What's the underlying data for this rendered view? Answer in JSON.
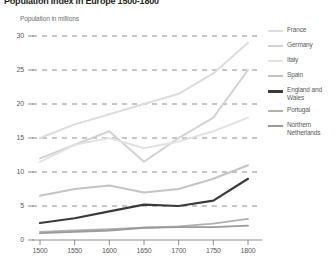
{
  "title": "Population Index in Europe 1500-1800",
  "subtitle": "Population in millions",
  "axis": {
    "y_ticks": [
      "30",
      "25",
      "20",
      "15",
      "10",
      "5",
      "0"
    ],
    "x_ticks": [
      "1500",
      "1550",
      "1600",
      "1650",
      "1700",
      "1750",
      "1800"
    ]
  },
  "legend": {
    "items": [
      {
        "label": "France",
        "color": "#dcdcdc"
      },
      {
        "label": "Germany",
        "color": "#d2d2d2"
      },
      {
        "label": "Italy",
        "color": "#e2e2e2"
      },
      {
        "label": "Spain",
        "color": "#c4c4c4"
      },
      {
        "label": "England and Wales",
        "color": "#3a3a3a"
      },
      {
        "label": "Portugal",
        "color": "#b0b0b0"
      },
      {
        "label": "Northern Netherlands",
        "color": "#9a9a9a"
      }
    ]
  },
  "chart_data": {
    "type": "line",
    "title": "Population Index in Europe 1500-1800",
    "xlabel": "",
    "ylabel": "Population in millions",
    "x": [
      1500,
      1550,
      1600,
      1650,
      1700,
      1750,
      1800
    ],
    "xlim": [
      1500,
      1800
    ],
    "ylim": [
      0,
      30
    ],
    "grid": "horizontal-dashed",
    "legend_position": "right",
    "series": [
      {
        "name": "France",
        "color": "#dcdcdc",
        "width": 2.0,
        "values": [
          15.0,
          17.0,
          18.5,
          20.0,
          21.5,
          24.5,
          29.0
        ]
      },
      {
        "name": "Germany",
        "color": "#d2d2d2",
        "width": 2.0,
        "values": [
          12.0,
          14.0,
          16.0,
          11.5,
          15.0,
          18.0,
          25.0
        ]
      },
      {
        "name": "Italy",
        "color": "#e2e2e2",
        "width": 2.0,
        "values": [
          11.5,
          14.0,
          15.0,
          13.5,
          14.5,
          16.0,
          18.0
        ]
      },
      {
        "name": "Spain",
        "color": "#c4c4c4",
        "width": 2.0,
        "values": [
          6.5,
          7.5,
          8.0,
          7.0,
          7.5,
          9.0,
          11.0
        ]
      },
      {
        "name": "England and Wales",
        "color": "#3a3a3a",
        "width": 2.2,
        "values": [
          2.5,
          3.2,
          4.2,
          5.2,
          5.0,
          5.8,
          9.0
        ]
      },
      {
        "name": "Portugal",
        "color": "#b0b0b0",
        "width": 1.8,
        "values": [
          1.2,
          1.4,
          1.6,
          1.8,
          2.0,
          2.4,
          3.1
        ]
      },
      {
        "name": "Northern Netherlands",
        "color": "#9a9a9a",
        "width": 1.8,
        "values": [
          1.0,
          1.2,
          1.4,
          1.8,
          1.9,
          1.9,
          2.1
        ]
      }
    ]
  }
}
